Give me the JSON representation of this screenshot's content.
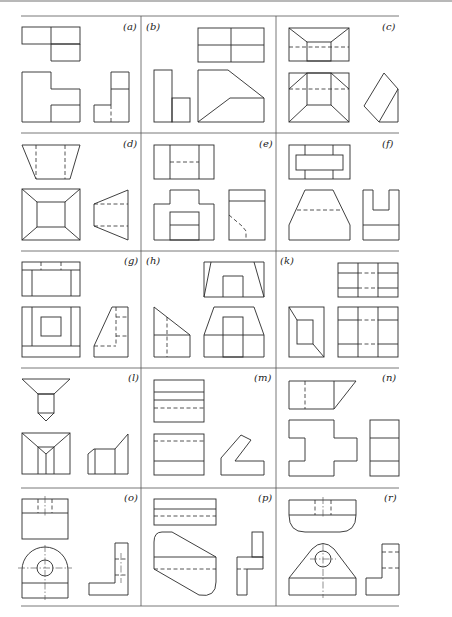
{
  "figure": {
    "type": "orthographic-projection-exercise-grid",
    "rows": 5,
    "columns": 3,
    "panels": [
      {
        "id": "a",
        "label": "(a)",
        "row": 0,
        "col": 0,
        "views": [
          "top",
          "front",
          "side"
        ]
      },
      {
        "id": "b",
        "label": "(b)",
        "row": 0,
        "col": 1,
        "views": [
          "top",
          "side",
          "front"
        ]
      },
      {
        "id": "c",
        "label": "(c)",
        "row": 0,
        "col": 2,
        "views": [
          "top",
          "front",
          "side"
        ]
      },
      {
        "id": "d",
        "label": "(d)",
        "row": 1,
        "col": 0,
        "views": [
          "top",
          "front",
          "side"
        ]
      },
      {
        "id": "e",
        "label": "(e)",
        "row": 1,
        "col": 1,
        "views": [
          "top",
          "front",
          "side"
        ]
      },
      {
        "id": "f",
        "label": "(f)",
        "row": 1,
        "col": 2,
        "views": [
          "top",
          "front",
          "side"
        ]
      },
      {
        "id": "g",
        "label": "(g)",
        "row": 2,
        "col": 0,
        "views": [
          "top",
          "front",
          "side"
        ]
      },
      {
        "id": "h",
        "label": "(h)",
        "row": 2,
        "col": 1,
        "views": [
          "top",
          "side",
          "front"
        ]
      },
      {
        "id": "k",
        "label": "(k)",
        "row": 2,
        "col": 2,
        "views": [
          "top",
          "side",
          "front"
        ]
      },
      {
        "id": "l",
        "label": "(l)",
        "row": 3,
        "col": 0,
        "views": [
          "top",
          "front",
          "side"
        ]
      },
      {
        "id": "m",
        "label": "(m)",
        "row": 3,
        "col": 1,
        "views": [
          "top",
          "front",
          "side"
        ]
      },
      {
        "id": "n",
        "label": "(n)",
        "row": 3,
        "col": 2,
        "views": [
          "top",
          "front",
          "side"
        ]
      },
      {
        "id": "o",
        "label": "(o)",
        "row": 4,
        "col": 0,
        "views": [
          "top",
          "front",
          "side"
        ]
      },
      {
        "id": "p",
        "label": "(p)",
        "row": 4,
        "col": 1,
        "views": [
          "top",
          "front",
          "side"
        ]
      },
      {
        "id": "r",
        "label": "(r)",
        "row": 4,
        "col": 2,
        "views": [
          "top",
          "front",
          "side"
        ]
      }
    ]
  },
  "colors": {
    "line": "#2a2a2a",
    "grid": "#555555",
    "background": "#ffffff"
  }
}
